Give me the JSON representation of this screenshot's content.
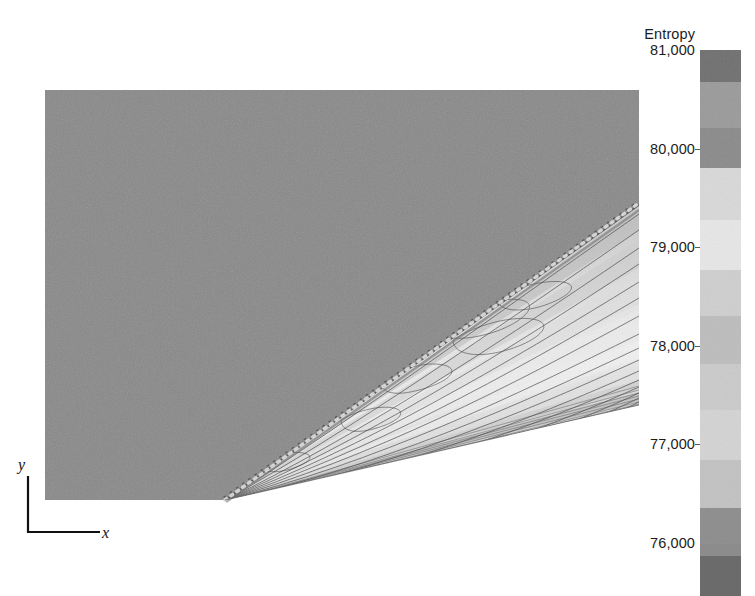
{
  "figure": {
    "type": "contour-field",
    "background": "#ffffff"
  },
  "colorbar": {
    "title": "Entropy",
    "orientation": "vertical",
    "min": 76000,
    "max": 81000,
    "labels": [
      {
        "text": "81,000",
        "value": 81000,
        "y": 50
      },
      {
        "text": "80,000",
        "value": 80000,
        "y": 149
      },
      {
        "text": "79,000",
        "value": 79000,
        "y": 247
      },
      {
        "text": "78,000",
        "value": 78000,
        "y": 346
      },
      {
        "text": "77,000",
        "value": 77000,
        "y": 444
      },
      {
        "text": "76,000",
        "value": 76000,
        "y": 543
      }
    ],
    "bands": [
      {
        "value": 80800,
        "color": "#6f6f6f",
        "top": 0,
        "height": 32
      },
      {
        "value": 80400,
        "color": "#9a9a9a",
        "top": 32,
        "height": 46
      },
      {
        "value": 79900,
        "color": "#8a8a8a",
        "top": 78,
        "height": 40
      },
      {
        "value": 79400,
        "color": "#d9d9d9",
        "top": 118,
        "height": 52
      },
      {
        "value": 78900,
        "color": "#e7e7e7",
        "top": 170,
        "height": 50
      },
      {
        "value": 78400,
        "color": "#cfcfcf",
        "top": 220,
        "height": 46
      },
      {
        "value": 77900,
        "color": "#bdbdbd",
        "top": 266,
        "height": 48
      },
      {
        "value": 77500,
        "color": "#cbcbcb",
        "top": 314,
        "height": 46
      },
      {
        "value": 77100,
        "color": "#d4d4d4",
        "top": 360,
        "height": 50
      },
      {
        "value": 76700,
        "color": "#c2c2c2",
        "top": 410,
        "height": 48
      },
      {
        "value": 76400,
        "color": "#8c8c8c",
        "top": 458,
        "height": 48
      },
      {
        "value": 76100,
        "color": "#6b6b6b",
        "top": 506,
        "height": 40
      }
    ],
    "ticks": [
      149,
      247,
      346,
      444
    ]
  },
  "axis_indicator": {
    "x_label": "x",
    "y_label": "y"
  },
  "chart_data": {
    "type": "heatmap",
    "title": "Entropy",
    "xlabel": "x",
    "ylabel": "y",
    "colorbar_label": "Entropy",
    "colorbar_range": [
      76000,
      81000
    ],
    "colorbar_ticks": [
      76000,
      77000,
      78000,
      79000,
      80000,
      81000
    ],
    "colorbar_tick_labels": [
      "76,000",
      "77,000",
      "78,000",
      "79,000",
      "80,000",
      "81,000"
    ],
    "grid": false,
    "legend": "colorbar-right",
    "regions": [
      {
        "name": "freestream",
        "entropy": 79900,
        "color": "#898989"
      },
      {
        "name": "post-shock-upper",
        "entropy": 79200,
        "color": "#b5b5b5"
      },
      {
        "name": "wake-core",
        "entropy": 78600,
        "color": "#d3d3d3"
      },
      {
        "name": "wake-bright-band",
        "entropy": 78100,
        "color": "#ececec"
      },
      {
        "name": "boundary-layer",
        "entropy": 77300,
        "color": "#c4c4c4"
      }
    ],
    "features": [
      {
        "name": "wedge-apex",
        "x_px": 180,
        "y_px": 410
      },
      {
        "name": "oblique-shock",
        "from_px": [
          180,
          410
        ],
        "to_px": [
          593,
          115
        ]
      },
      {
        "name": "lower-surface",
        "from_px": [
          180,
          410
        ],
        "to_px": [
          593,
          315
        ]
      }
    ]
  }
}
